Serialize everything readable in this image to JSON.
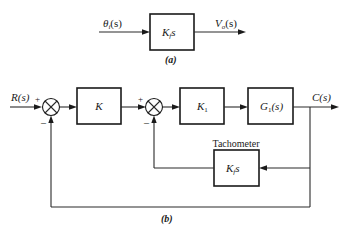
{
  "diagram_a": {
    "input_label": "θ",
    "input_sub": "i",
    "input_tail": "(s)",
    "block": {
      "main": "K",
      "sub": "f",
      "tail": "s"
    },
    "output_label": "V",
    "output_sub": "o",
    "output_tail": "(s)",
    "caption": "(a)"
  },
  "diagram_b": {
    "input_label": "R(s)",
    "summer1": {
      "plus": "+",
      "minus": "–"
    },
    "block_k": "K",
    "summer2": {
      "plus": "+",
      "minus": "–"
    },
    "block_k1": {
      "main": "K",
      "sub": "1"
    },
    "block_g1": {
      "main": "G",
      "sub": "1",
      "tail": "(s)"
    },
    "output_label": "C(s)",
    "tachometer_title": "Tachometer",
    "tachometer_block": {
      "main": "K",
      "sub": "f",
      "tail": "s"
    },
    "caption": "(b)"
  },
  "colors": {
    "line": "#1a1a1a",
    "background": "#ffffff"
  }
}
